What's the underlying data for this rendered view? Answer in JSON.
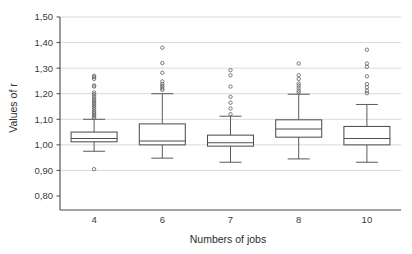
{
  "chart_data": {
    "type": "box",
    "title": "",
    "xlabel": "Numbers of jobs",
    "ylabel": "Values of r",
    "categories": [
      "4",
      "6",
      "7",
      "8",
      "10"
    ],
    "ylim": [
      0.8,
      1.5
    ],
    "ytick_labels": [
      "1,50",
      "1,40",
      "1,30",
      "1,20",
      "1,10",
      "1,00",
      "0,90",
      "0,80"
    ],
    "ytick_values": [
      1.5,
      1.4,
      1.3,
      1.2,
      1.1,
      1.0,
      0.9,
      0.8
    ],
    "decimal_separator": ",",
    "grid": "horizontal",
    "legend": "none",
    "boxes": [
      {
        "category": "4",
        "whisker_low": 0.975,
        "q1": 1.012,
        "median": 1.025,
        "q3": 1.05,
        "whisker_high": 1.1,
        "outliers_high": [
          1.27,
          1.265,
          1.258,
          1.232,
          1.228,
          1.205,
          1.198,
          1.19,
          1.182,
          1.175,
          1.168,
          1.16,
          1.152,
          1.145,
          1.138,
          1.13,
          1.124,
          1.118,
          1.112,
          1.106
        ],
        "outliers_low": [
          0.905
        ]
      },
      {
        "category": "6",
        "whisker_low": 0.948,
        "q1": 1.0,
        "median": 1.015,
        "q3": 1.082,
        "whisker_high": 1.2,
        "outliers_high": [
          1.38,
          1.32,
          1.282,
          1.248,
          1.238,
          1.23,
          1.222,
          1.215
        ],
        "outliers_low": []
      },
      {
        "category": "7",
        "whisker_low": 0.932,
        "q1": 0.995,
        "median": 1.008,
        "q3": 1.038,
        "whisker_high": 1.112,
        "outliers_high": [
          1.292,
          1.272,
          1.228,
          1.188,
          1.165,
          1.142,
          1.12
        ],
        "outliers_low": []
      },
      {
        "category": "8",
        "whisker_low": 0.945,
        "q1": 1.03,
        "median": 1.062,
        "q3": 1.098,
        "whisker_high": 1.198,
        "outliers_high": [
          1.318,
          1.272,
          1.258,
          1.24,
          1.232,
          1.222,
          1.212,
          1.205
        ],
        "outliers_low": []
      },
      {
        "category": "10",
        "whisker_low": 0.932,
        "q1": 1.0,
        "median": 1.025,
        "q3": 1.072,
        "whisker_high": 1.158,
        "outliers_high": [
          1.372,
          1.318,
          1.305,
          1.268,
          1.238,
          1.225,
          1.212,
          1.202
        ],
        "outliers_low": []
      }
    ]
  },
  "axes": {
    "y_title": "Values of r",
    "x_title": "Numbers of jobs"
  },
  "colors": {
    "gridline": "#c9c9c9",
    "axis": "#4a4a4a",
    "box_stroke": "#4f4f4f",
    "outlier_stroke": "#646464",
    "background": "#ffffff"
  }
}
